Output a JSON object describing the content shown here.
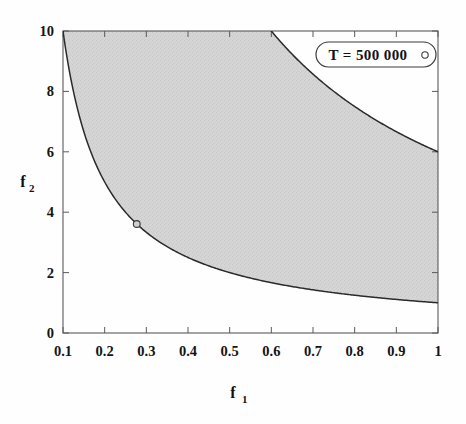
{
  "chart_data": {
    "type": "area",
    "title": "",
    "subtitle": "",
    "xlabel": "f",
    "xlabel_sub": "1",
    "ylabel": "f",
    "ylabel_sub": "2",
    "xlim": [
      0.1,
      1.0
    ],
    "ylim": [
      0,
      10
    ],
    "x_tick_labels": [
      "0.1",
      "0.2",
      "0.3",
      "0.4",
      "0.5",
      "0.6",
      "0.7",
      "0.8",
      "0.9",
      "1"
    ],
    "x_tick_values": [
      0.1,
      0.2,
      0.3,
      0.4,
      0.5,
      0.6,
      0.7,
      0.8,
      0.9,
      1.0
    ],
    "y_tick_labels": [
      "0",
      "2",
      "4",
      "6",
      "8",
      "10"
    ],
    "y_tick_values": [
      0,
      2,
      4,
      6,
      8,
      10
    ],
    "grid": false,
    "legend_position": "top-right",
    "legend_entries": [
      {
        "label": "T = 500 000",
        "marker": "open-circle"
      }
    ],
    "series": [
      {
        "name": "lower boundary",
        "relation": "f1 * f2 = 1",
        "x": [
          0.1,
          0.12,
          0.14,
          0.16,
          0.18,
          0.2,
          0.25,
          0.3,
          0.35,
          0.4,
          0.45,
          0.5,
          0.55,
          0.6,
          0.65,
          0.7,
          0.75,
          0.8,
          0.85,
          0.9,
          0.95,
          1.0
        ],
        "y": [
          10.0,
          8.33,
          7.14,
          6.25,
          5.56,
          5.0,
          4.0,
          3.33,
          2.86,
          2.5,
          2.22,
          2.0,
          1.82,
          1.67,
          1.54,
          1.43,
          1.33,
          1.25,
          1.18,
          1.11,
          1.05,
          1.0
        ]
      },
      {
        "name": "upper boundary",
        "relation": "f1 * f2 = 6",
        "x": [
          0.6,
          0.62,
          0.65,
          0.7,
          0.75,
          0.8,
          0.85,
          0.9,
          0.95,
          1.0
        ],
        "y": [
          10.0,
          9.68,
          9.23,
          8.57,
          8.0,
          7.5,
          7.06,
          6.67,
          6.32,
          6.0
        ]
      }
    ],
    "shaded_region": {
      "description": "region between f1*f2 = 1 and f1*f2 = 6 clipped to axes",
      "fill_color": "#d2d2d2",
      "texture": "stippled"
    },
    "data_points": [
      {
        "name": "highlighted-solution",
        "x": 0.277,
        "y": 3.61,
        "marker": "open-circle"
      }
    ]
  },
  "legend": {
    "label": "T = 500 000"
  },
  "axes": {
    "x_title": "f",
    "x_title_sub": "1",
    "y_title": "f",
    "y_title_sub": "2"
  }
}
